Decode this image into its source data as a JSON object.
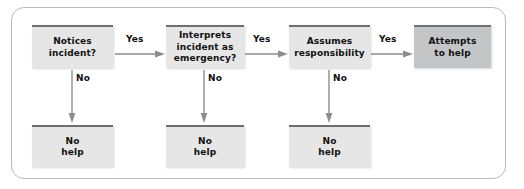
{
  "figure": {
    "frame": {
      "border_color": "#b9babb",
      "background": "#ffffff"
    }
  },
  "palette": {
    "box_fill": "#e6e6e6",
    "box_fill_shaded": "#c4c5c6",
    "box_top_bar": "#6e6f71",
    "text": "#111111",
    "arrow": "#8c8d8f"
  },
  "nodes": [
    {
      "id": "notices",
      "label": "Notices\nincident?",
      "lines": [
        "Notices",
        "incident?"
      ],
      "shaded": false
    },
    {
      "id": "interprets",
      "label": "Interprets\nincident as\nemergency?",
      "lines": [
        "Interprets",
        "incident as",
        "emergency?"
      ],
      "shaded": false
    },
    {
      "id": "assumes",
      "label": "Assumes\nresponsibility",
      "lines": [
        "Assumes",
        "responsibility"
      ],
      "shaded": false
    },
    {
      "id": "attempts",
      "label": "Attempts\nto help",
      "lines": [
        "Attempts",
        "to help"
      ],
      "shaded": true
    },
    {
      "id": "no-help-1",
      "label": "No\nhelp",
      "lines": [
        "No",
        "help"
      ],
      "shaded": false
    },
    {
      "id": "no-help-2",
      "label": "No\nhelp",
      "lines": [
        "No",
        "help"
      ],
      "shaded": false
    },
    {
      "id": "no-help-3",
      "label": "No\nhelp",
      "lines": [
        "No",
        "help"
      ],
      "shaded": false
    }
  ],
  "edges": {
    "yes_1": "Yes",
    "yes_2": "Yes",
    "yes_3": "Yes",
    "no_1": "No",
    "no_2": "No",
    "no_3": "No"
  }
}
